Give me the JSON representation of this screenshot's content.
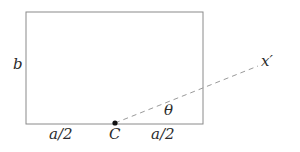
{
  "figure": {
    "background_color": "#ffffff",
    "outline_color": "#8a8a8a",
    "dashed_line_color": "#9a9a9a",
    "point_color": "#111111",
    "text_color": "#2b2b2b",
    "rectangle": {
      "name": "rectangle-outline",
      "x": 26,
      "y": 12,
      "width": 177,
      "height": 112,
      "stroke_width": 1
    },
    "centroid_point": {
      "name": "point-c",
      "x": 115,
      "y": 123,
      "radius": 2.6
    },
    "axis_line": {
      "name": "x-prime-axis",
      "x1": 115,
      "y1": 123,
      "x2": 258,
      "y2": 66,
      "dash_pattern": "5 4",
      "stroke_width": 1
    },
    "labels": {
      "height": "b",
      "half_width_left": "a/2",
      "centroid": "C",
      "half_width_right": "a/2",
      "angle": "θ",
      "axis": "x′"
    }
  }
}
